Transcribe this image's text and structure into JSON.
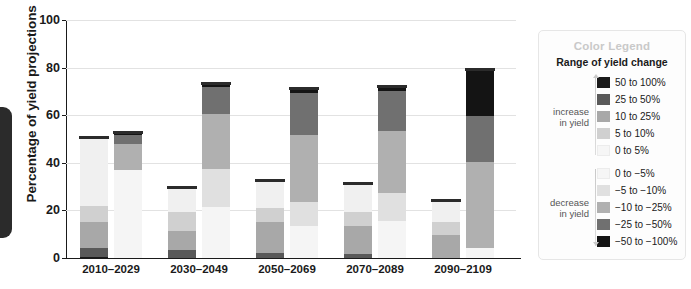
{
  "left_tab": {
    "name": "page-edge-tab"
  },
  "chart_data": {
    "type": "bar",
    "subtype": "grouped-stacked",
    "title": "",
    "xlabel": "",
    "ylabel": "Percentage of yield projections",
    "ylim": [
      0,
      100
    ],
    "yticks": [
      0,
      20,
      40,
      60,
      80,
      100
    ],
    "ytick_labels": [
      "0",
      "20",
      "40",
      "60",
      "80",
      "100"
    ],
    "grid": true,
    "legend_position": "right",
    "categories": [
      "2010–2029",
      "2030–2049",
      "2050–2069",
      "2070–2089",
      "2090–2109"
    ],
    "bar_kinds": [
      "increase in yield",
      "decrease in yield"
    ],
    "series": [
      {
        "name": "50 to 100%",
        "group": "increase",
        "color": "#1a1a1a",
        "values": [
          0.5,
          0.0,
          0.0,
          0.0,
          0.0
        ]
      },
      {
        "name": "25 to 50%",
        "group": "increase",
        "color": "#595959",
        "values": [
          3.5,
          3.3,
          2.0,
          1.5,
          0.0
        ]
      },
      {
        "name": "10 to 25%",
        "group": "increase",
        "color": "#a8a8a8",
        "values": [
          11.0,
          8.0,
          13.0,
          12.0,
          9.5
        ]
      },
      {
        "name": "5 to 10%",
        "group": "increase",
        "color": "#d0d0d0",
        "values": [
          7.0,
          8.0,
          6.0,
          6.0,
          5.5
        ]
      },
      {
        "name": "0 to 5%",
        "group": "increase",
        "color": "#f0f0f0",
        "values": [
          28.0,
          9.5,
          11.0,
          11.0,
          8.5
        ]
      },
      {
        "name": "0 to −5%",
        "group": "decrease",
        "color": "#f5f5f5",
        "values": [
          37.0,
          21.5,
          13.5,
          15.5,
          4.0
        ]
      },
      {
        "name": "−5 to −10%",
        "group": "decrease",
        "color": "#e0e0e0",
        "values": [
          0.0,
          16.0,
          10.0,
          12.0,
          0.0
        ]
      },
      {
        "name": "−10 to −25%",
        "group": "decrease",
        "color": "#b0b0b0",
        "values": [
          11.0,
          23.0,
          28.0,
          26.0,
          36.5
        ]
      },
      {
        "name": "−25 to −50%",
        "group": "decrease",
        "color": "#707070",
        "values": [
          3.5,
          11.5,
          18.0,
          16.5,
          19.0
        ]
      },
      {
        "name": "−50 to −100%",
        "group": "decrease",
        "color": "#141414",
        "values": [
          0.5,
          0.5,
          1.0,
          1.5,
          19.0
        ]
      }
    ],
    "bar_totals": {
      "increase": [
        50.0,
        28.8,
        32.0,
        30.5,
        23.5
      ],
      "decrease": [
        52.0,
        72.5,
        70.5,
        71.5,
        78.5
      ]
    }
  },
  "legend": {
    "title": "Color Legend",
    "subtitle": "Range of yield change",
    "increase_label_line1": "increase",
    "increase_label_line2": "in yield",
    "decrease_label_line1": "decrease",
    "decrease_label_line2": "in yield",
    "increase_items": [
      {
        "label": "50 to 100%",
        "color": "#1a1a1a"
      },
      {
        "label": "25 to 50%",
        "color": "#595959"
      },
      {
        "label": "10 to 25%",
        "color": "#a8a8a8"
      },
      {
        "label": "5 to 10%",
        "color": "#d0d0d0"
      },
      {
        "label": "0 to 5%",
        "color": "#f6f6f6"
      }
    ],
    "decrease_items": [
      {
        "label": "0 to −5%",
        "color": "#f6f6f6"
      },
      {
        "label": "−5 to −10%",
        "color": "#e0e0e0"
      },
      {
        "label": "−10 to −25%",
        "color": "#b0b0b0"
      },
      {
        "label": "−25 to −50%",
        "color": "#707070"
      },
      {
        "label": "−50 to −100%",
        "color": "#141414"
      }
    ]
  }
}
